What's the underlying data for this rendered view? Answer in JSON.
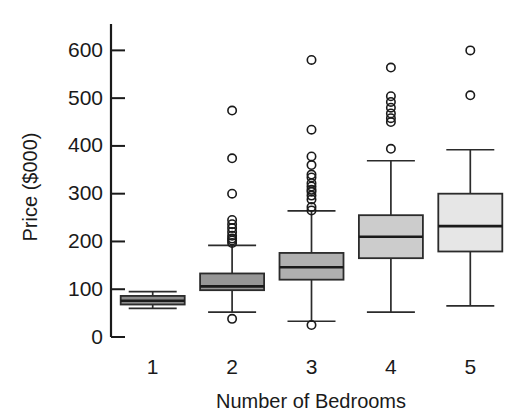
{
  "chart_data": {
    "type": "box",
    "title": "",
    "xlabel": "Number of Bedrooms",
    "ylabel": "Price ($000)",
    "categories": [
      "1",
      "2",
      "3",
      "4",
      "5"
    ],
    "ylim": [
      0,
      650
    ],
    "yticks": [
      0,
      100,
      200,
      300,
      400,
      500,
      600
    ],
    "ytick_labels": [
      "0",
      "100",
      "200",
      "300",
      "400",
      "500",
      "600"
    ],
    "grid": false,
    "legend": "none",
    "boxes": [
      {
        "category": "1",
        "fill": "#8c8c8c",
        "whisker_low": 60,
        "q1": 68,
        "median": 76,
        "q3": 86,
        "whisker_high": 95,
        "outliers": []
      },
      {
        "category": "2",
        "fill": "#969696",
        "whisker_low": 52,
        "q1": 98,
        "median": 106,
        "q3": 133,
        "whisker_high": 192,
        "outliers": [
          38,
          197,
          202,
          206,
          212,
          220,
          228,
          236,
          245,
          300,
          374,
          474
        ]
      },
      {
        "category": "3",
        "fill": "#b0b0b0",
        "whisker_low": 33,
        "q1": 120,
        "median": 146,
        "q3": 176,
        "whisker_high": 264,
        "outliers": [
          25,
          265,
          272,
          288,
          296,
          304,
          308,
          315,
          322,
          334,
          340,
          360,
          378,
          434,
          580
        ]
      },
      {
        "category": "4",
        "fill": "#cccccc",
        "whisker_low": 52,
        "q1": 165,
        "median": 210,
        "q3": 255,
        "whisker_high": 369,
        "outliers": [
          394,
          450,
          458,
          468,
          480,
          492,
          504,
          564
        ]
      },
      {
        "category": "5",
        "fill": "#e6e6e6",
        "whisker_low": 65,
        "q1": 179,
        "median": 232,
        "q3": 300,
        "whisker_high": 392,
        "outliers": [
          506,
          600
        ]
      }
    ]
  },
  "geometry": {
    "plot_left": 113,
    "plot_right": 510,
    "y_zero_px": 337,
    "y_top_px": 37,
    "y_top_value": 628,
    "box_half_width": 32,
    "cap_half_width": 24,
    "outlier_radius": 4.2
  }
}
